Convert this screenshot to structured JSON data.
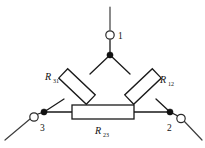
{
  "figure": {
    "kind": "circuit-diagram",
    "name": "delta-connection-resistor-network",
    "background_color": "#ffffff",
    "line_color": "#1a1a1a",
    "width": 205,
    "height": 148
  },
  "terminals": [
    {
      "id": "terminal-1",
      "label": "1",
      "marker": "open-circle",
      "position": "top"
    },
    {
      "id": "terminal-2",
      "label": "2",
      "marker": "open-circle",
      "position": "bottom-right"
    },
    {
      "id": "terminal-3",
      "label": "3",
      "marker": "open-circle",
      "position": "bottom-left"
    }
  ],
  "resistors": [
    {
      "id": "resistor-r31",
      "symbol": "R",
      "subscript": "31",
      "label": "R31",
      "orientation": "diagonal-left",
      "between": [
        "node-1",
        "node-3"
      ]
    },
    {
      "id": "resistor-r12",
      "symbol": "R",
      "subscript": "12",
      "label": "R12",
      "orientation": "diagonal-right",
      "between": [
        "node-1",
        "node-2"
      ]
    },
    {
      "id": "resistor-r23",
      "symbol": "R",
      "subscript": "23",
      "label": "R23",
      "orientation": "horizontal",
      "between": [
        "node-2",
        "node-3"
      ]
    }
  ],
  "nodes": [
    {
      "id": "node-1",
      "marker": "filled-dot",
      "x": 110,
      "y": 55
    },
    {
      "id": "node-2",
      "marker": "filled-dot",
      "x": 170,
      "y": 112
    },
    {
      "id": "node-3",
      "marker": "filled-dot",
      "x": 44,
      "y": 112
    }
  ]
}
